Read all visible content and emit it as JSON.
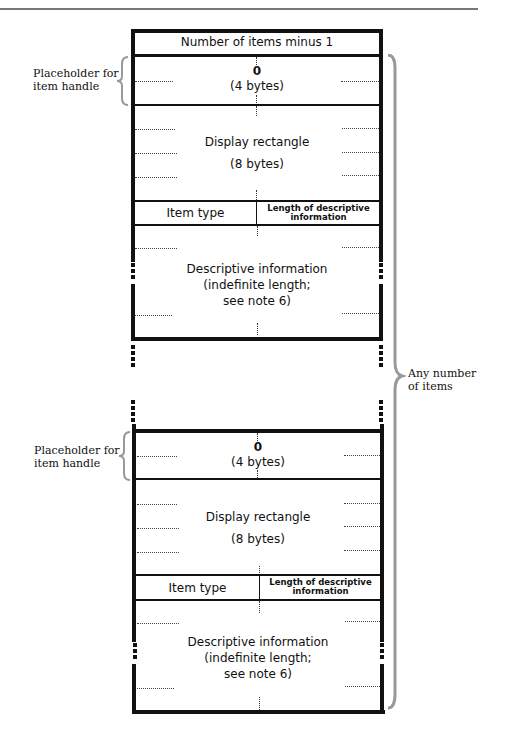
{
  "figure": {
    "header_row": "Number of items minus 1",
    "items": [
      {
        "placeholder_value": "0",
        "placeholder_size": "(4 bytes)",
        "display_rect_label": "Display rectangle",
        "display_rect_size": "(8 bytes)",
        "item_type": "Item type",
        "length_label_line1": "Length of descriptive",
        "length_label_line2": "information",
        "desc_line1": "Descriptive information",
        "desc_line2": "(indefinite length;",
        "desc_line3": "see note 6)"
      },
      {
        "placeholder_value": "0",
        "placeholder_size": "(4 bytes)",
        "display_rect_label": "Display rectangle",
        "display_rect_size": "(8 bytes)",
        "item_type": "Item type",
        "length_label_line1": "Length of descriptive",
        "length_label_line2": "information",
        "desc_line1": "Descriptive information",
        "desc_line2": "(indefinite length;",
        "desc_line3": "see note 6)"
      }
    ],
    "annotations": {
      "placeholder_line1": "Placeholder for",
      "placeholder_line2": "item handle",
      "any_number_line1": "Any number",
      "any_number_line2": "of items"
    }
  }
}
